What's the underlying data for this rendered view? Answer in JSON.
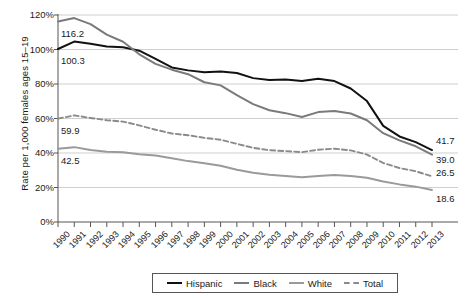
{
  "chart_data": {
    "type": "line",
    "title": "",
    "xlabel": "",
    "ylabel": "Rate per 1,000 females ages 15–19",
    "ylim": [
      0,
      120
    ],
    "ytick_labels": [
      "0%",
      "20%",
      "40%",
      "60%",
      "80%",
      "100%",
      "120%"
    ],
    "ytick_values": [
      0,
      20,
      40,
      60,
      80,
      100,
      120
    ],
    "grid": true,
    "legend_position": "bottom",
    "x": [
      1990,
      1991,
      1992,
      1993,
      1994,
      1995,
      1996,
      1997,
      1998,
      1999,
      2000,
      2001,
      2002,
      2003,
      2004,
      2005,
      2006,
      2007,
      2008,
      2009,
      2010,
      2011,
      2012,
      2013
    ],
    "categories": [
      "1990",
      "1991",
      "1992",
      "1993",
      "1994",
      "1995",
      "1996",
      "1997",
      "1998",
      "1999",
      "2000",
      "2001",
      "2002",
      "2003",
      "2004",
      "2005",
      "2006",
      "2007",
      "2008",
      "2009",
      "2010",
      "2011",
      "2012",
      "2013"
    ],
    "series": [
      {
        "name": "Hispanic",
        "color": "#111111",
        "style": "solid",
        "start_label": "100.3",
        "end_label": "41.7",
        "values": [
          100.3,
          104.6,
          103.3,
          101.8,
          101.3,
          99.3,
          94.6,
          89.6,
          87.9,
          86.8,
          87.3,
          86.4,
          83.4,
          82.3,
          82.6,
          81.7,
          83.0,
          81.7,
          77.4,
          70.1,
          55.7,
          49.6,
          46.3,
          41.7
        ]
      },
      {
        "name": "Black",
        "color": "#7a7a7a",
        "style": "solid",
        "start_label": "116.2",
        "end_label": "39.0",
        "values": [
          116.2,
          118.2,
          114.7,
          108.6,
          104.5,
          97.2,
          91.7,
          88.3,
          85.7,
          81.0,
          79.2,
          73.5,
          68.3,
          64.8,
          63.1,
          60.9,
          63.7,
          64.3,
          62.9,
          59.0,
          51.5,
          47.3,
          43.9,
          39.0
        ]
      },
      {
        "name": "White",
        "color": "#9a9a9a",
        "style": "solid",
        "start_label": "42.5",
        "end_label": "18.6",
        "values": [
          42.5,
          43.4,
          41.7,
          40.7,
          40.4,
          39.3,
          38.6,
          37.0,
          35.3,
          34.1,
          32.6,
          30.3,
          28.5,
          27.4,
          26.7,
          25.9,
          26.6,
          27.2,
          26.7,
          25.6,
          23.5,
          21.8,
          20.5,
          18.6
        ]
      },
      {
        "name": "Total",
        "color": "#8a8a8a",
        "style": "dashed",
        "start_label": "59.9",
        "end_label": "26.5",
        "values": [
          59.9,
          61.8,
          60.3,
          59.0,
          58.2,
          56.0,
          53.5,
          51.3,
          50.3,
          48.8,
          47.7,
          45.3,
          43.0,
          41.6,
          41.1,
          40.5,
          41.9,
          42.5,
          41.5,
          39.1,
          34.2,
          31.3,
          29.4,
          26.5
        ]
      }
    ]
  },
  "legend": {
    "items": [
      {
        "label": "Hispanic",
        "color": "#111111",
        "style": "solid"
      },
      {
        "label": "Black",
        "color": "#7a7a7a",
        "style": "solid"
      },
      {
        "label": "White",
        "color": "#9a9a9a",
        "style": "solid"
      },
      {
        "label": "Total",
        "color": "#8a8a8a",
        "style": "dashed"
      }
    ]
  }
}
